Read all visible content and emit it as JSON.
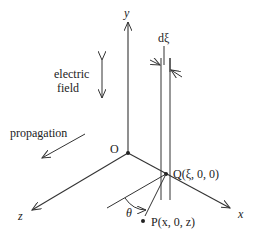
{
  "diagram": {
    "axes": {
      "y_label": "y",
      "x_label": "x",
      "z_label": "z",
      "origin_label": "O"
    },
    "annotations": {
      "electric_field_line1": "electric",
      "electric_field_line2": "field",
      "propagation": "propagation",
      "slab_width": "dξ",
      "angle": "θ"
    },
    "points": {
      "Q": {
        "label": "Q(ξ, 0, 0)"
      },
      "P": {
        "label": "P(x, 0, z)"
      }
    },
    "colors": {
      "stroke": "#333333",
      "text": "#222222",
      "background": "#ffffff"
    }
  }
}
